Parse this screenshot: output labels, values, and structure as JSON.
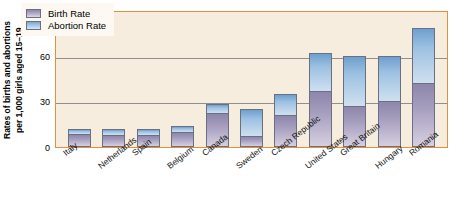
{
  "chart_data": {
    "type": "bar",
    "subtype": "stacked-vertical",
    "title": "",
    "xlabel": "",
    "ylabel": "Rates of births and abortions per 1,000 girls aged 15–19",
    "ylabel_line1": "Rates of births and abortions",
    "ylabel_line2": "per 1,000 girls aged 15–19",
    "ylim": [
      0,
      90
    ],
    "yticks": [
      0,
      30,
      60,
      90
    ],
    "ytick_labels": [
      "0",
      "30",
      "60",
      "90"
    ],
    "grid": "horizontal",
    "legend_position": "top-left-inside",
    "categories": [
      "Italy",
      "Netherlands",
      "Spain",
      "Belgium",
      "Canada",
      "Sweden",
      "Czech Republic",
      "United States",
      "Great Britain",
      "Hungary",
      "Romania"
    ],
    "series": [
      {
        "name": "Birth Rate",
        "color": "#a79fbf",
        "values": [
          9,
          8,
          8,
          10,
          23,
          7,
          21,
          37,
          27,
          30,
          42
        ]
      },
      {
        "name": "Abortion Rate",
        "color": "#9dc1e2",
        "values": [
          3,
          4,
          4,
          4,
          5,
          18,
          14,
          25,
          33,
          30,
          36
        ]
      }
    ],
    "totals": [
      12,
      12,
      12,
      14,
      28,
      25,
      35,
      62,
      60,
      60,
      78
    ]
  },
  "legend": {
    "items": [
      {
        "label": "Birth Rate",
        "swatch": "birth-rate-swatch"
      },
      {
        "label": "Abortion Rate",
        "swatch": "abortion-rate-swatch"
      }
    ]
  },
  "colors": {
    "plot_background": "#f6eddf",
    "axis_frame": "#e0913f",
    "gridline": "#8f8f8f",
    "birth_rate": "#a79fbf",
    "abortion_rate": "#9dc1e2",
    "bar_outline": "#6b6f82"
  },
  "caption": {
    "text": ""
  }
}
